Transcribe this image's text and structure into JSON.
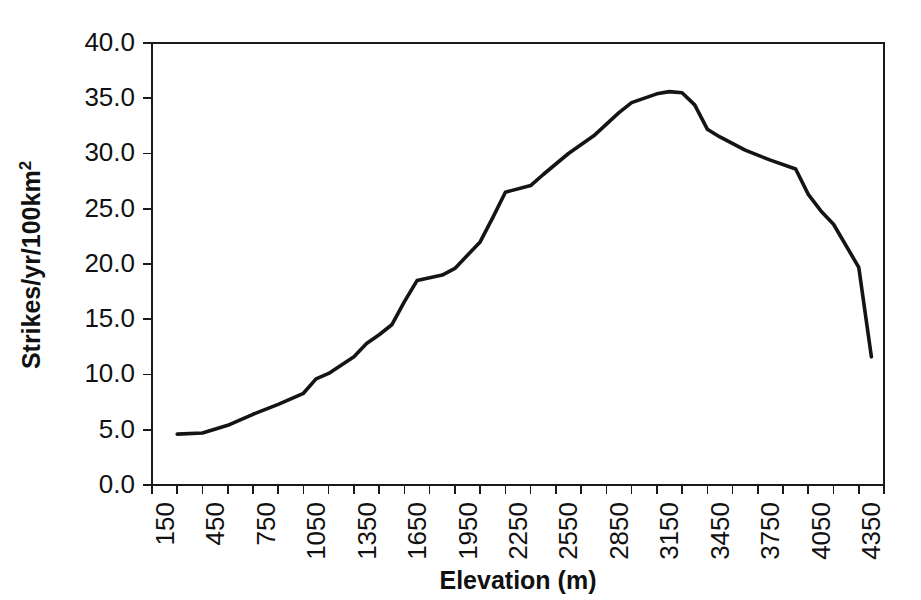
{
  "chart_data": {
    "type": "line",
    "title": "",
    "xlabel": "Elevation (m)",
    "ylabel": "Strikes/yr/100km²",
    "ylabel_base": "Strikes/yr/100km",
    "ylabel_sup": "2",
    "grid": false,
    "legend": "none",
    "xlim": [
      75,
      4425
    ],
    "ylim": [
      0,
      40
    ],
    "x_tick_labels": [
      "150",
      "450",
      "750",
      "1050",
      "1350",
      "1650",
      "1950",
      "2250",
      "2550",
      "2850",
      "3150",
      "3450",
      "3750",
      "4050",
      "4350"
    ],
    "y_tick_labels": [
      "0.0",
      "5.0",
      "10.0",
      "15.0",
      "20.0",
      "25.0",
      "30.0",
      "35.0",
      "40.0"
    ],
    "y_tick_values": [
      0,
      5,
      10,
      15,
      20,
      25,
      30,
      35,
      40
    ],
    "x": [
      225,
      375,
      525,
      675,
      825,
      975,
      1125,
      1275,
      1425,
      1575,
      1725,
      1875,
      2025,
      2175,
      2325,
      2475,
      2625,
      2775,
      2925,
      3075,
      3225,
      3375,
      3525,
      3675,
      3825,
      3975,
      4125,
      4275,
      4350
    ],
    "values": [
      4.6,
      4.7,
      5.4,
      6.3,
      7.2,
      8.2,
      9.6,
      10.1,
      11.5,
      12.8,
      13.6,
      14.5,
      16.5,
      18.5,
      18.9,
      19.5,
      21.8,
      24.0,
      26.5,
      27.1,
      28.1,
      30.0,
      31.5,
      33.6,
      34.6,
      35.4,
      35.6,
      35.5,
      34.4
    ],
    "series": [
      {
        "name": "Lightning strike density",
        "points": [
          {
            "x": 225,
            "y": 4.6
          },
          {
            "x": 375,
            "y": 4.7
          },
          {
            "x": 525,
            "y": 5.4
          },
          {
            "x": 675,
            "y": 6.4
          },
          {
            "x": 825,
            "y": 7.3
          },
          {
            "x": 975,
            "y": 8.3
          },
          {
            "x": 1050,
            "y": 9.6
          },
          {
            "x": 1125,
            "y": 10.1
          },
          {
            "x": 1275,
            "y": 11.6
          },
          {
            "x": 1350,
            "y": 12.8
          },
          {
            "x": 1425,
            "y": 13.6
          },
          {
            "x": 1500,
            "y": 14.5
          },
          {
            "x": 1575,
            "y": 16.6
          },
          {
            "x": 1650,
            "y": 18.5
          },
          {
            "x": 1800,
            "y": 19.0
          },
          {
            "x": 1875,
            "y": 19.6
          },
          {
            "x": 2025,
            "y": 22.0
          },
          {
            "x": 2100,
            "y": 24.2
          },
          {
            "x": 2175,
            "y": 26.5
          },
          {
            "x": 2325,
            "y": 27.1
          },
          {
            "x": 2400,
            "y": 28.1
          },
          {
            "x": 2550,
            "y": 30.0
          },
          {
            "x": 2700,
            "y": 31.6
          },
          {
            "x": 2850,
            "y": 33.7
          },
          {
            "x": 2925,
            "y": 34.6
          },
          {
            "x": 3075,
            "y": 35.4
          },
          {
            "x": 3150,
            "y": 35.6
          },
          {
            "x": 3225,
            "y": 35.5
          },
          {
            "x": 3300,
            "y": 34.4
          },
          {
            "x": 3375,
            "y": 32.2
          },
          {
            "x": 3450,
            "y": 31.5
          },
          {
            "x": 3600,
            "y": 30.3
          },
          {
            "x": 3750,
            "y": 29.4
          },
          {
            "x": 3900,
            "y": 28.6
          },
          {
            "x": 3975,
            "y": 26.3
          },
          {
            "x": 4050,
            "y": 24.8
          },
          {
            "x": 4125,
            "y": 23.6
          },
          {
            "x": 4275,
            "y": 19.7
          },
          {
            "x": 4350,
            "y": 11.6
          }
        ]
      }
    ],
    "peak": {
      "x": 3150,
      "y": 35.6
    },
    "start": {
      "x": 225,
      "y": 4.6
    },
    "end": {
      "x": 4350,
      "y": 11.6
    }
  }
}
